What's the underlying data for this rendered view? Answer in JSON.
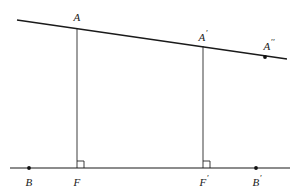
{
  "figure": {
    "kind": "geometry-diagram",
    "background_color": "#ffffff",
    "stroke_color": "#1a1a1a",
    "width": 296,
    "height": 194,
    "lines": [
      {
        "name": "transversal",
        "x1": 17,
        "y1": 20,
        "x2": 287,
        "y2": 59,
        "style": "transversal-line"
      },
      {
        "name": "baseline",
        "x1": 10,
        "y1": 168,
        "x2": 290,
        "y2": 168,
        "style": "baseline-line"
      },
      {
        "name": "perpendicular-a-f",
        "x1": 77,
        "y1": 28,
        "x2": 77,
        "y2": 168,
        "style": "drop-line"
      },
      {
        "name": "perpendicular-aprime-fprime",
        "x1": 203,
        "y1": 46,
        "x2": 203,
        "y2": 168,
        "style": "drop-line"
      }
    ],
    "right_angles": [
      {
        "name": "right-angle-at-f",
        "x": 77,
        "y": 168,
        "size": 7
      },
      {
        "name": "right-angle-at-fprime",
        "x": 203,
        "y": 168,
        "size": 7
      }
    ],
    "dots": [
      {
        "name": "dot-b",
        "x": 29,
        "y": 168,
        "r": 1.9
      },
      {
        "name": "dot-bprime",
        "x": 256,
        "y": 168,
        "r": 1.9
      },
      {
        "name": "dot-adoubleprime",
        "x": 265,
        "y": 57,
        "r": 1.9
      }
    ],
    "labels": [
      {
        "name": "label-a",
        "base": "A",
        "primes": "",
        "x": 77,
        "y": 16
      },
      {
        "name": "label-aprime",
        "base": "A",
        "primes": "′",
        "x": 203,
        "y": 36
      },
      {
        "name": "label-adoubleprime",
        "base": "A",
        "primes": "′′",
        "x": 269,
        "y": 45
      },
      {
        "name": "label-b",
        "base": "B",
        "primes": "",
        "x": 29,
        "y": 181
      },
      {
        "name": "label-f",
        "base": "F",
        "primes": "",
        "x": 77,
        "y": 181
      },
      {
        "name": "label-fprime",
        "base": "F",
        "primes": "′",
        "x": 204,
        "y": 181
      },
      {
        "name": "label-bprime",
        "base": "B",
        "primes": "′",
        "x": 257,
        "y": 181
      }
    ]
  }
}
